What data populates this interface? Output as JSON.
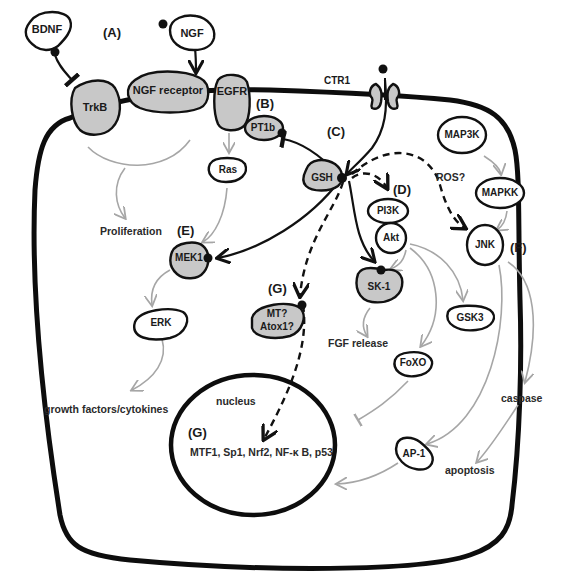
{
  "diagram": {
    "type": "signaling-pathway",
    "compartments": {
      "cell": "cell",
      "nucleus": "nucleus"
    },
    "section_labels": {
      "A": "(A)",
      "B": "(B)",
      "C": "(C)",
      "D": "(D)",
      "E": "(E)",
      "F": "(F)",
      "G1": "(G)",
      "G2": "(G)"
    },
    "nodes": {
      "bdnf": "BDNF",
      "ngf": "NGF",
      "trkb": "TrkB",
      "ngf_receptor": "NGF receptor",
      "egfr": "EGFR",
      "ctr1": "CTR1",
      "pt1b": "PT1b",
      "ras": "Ras",
      "gsh": "GSH",
      "pi3k": "PI3K",
      "akt": "Akt",
      "map3k": "MAP3K",
      "mapkk": "MAPKK",
      "jnk": "JNK",
      "mek1": "MEK1",
      "erk": "ERK",
      "mt_line1": "MT?",
      "mt_line2": "Atox1?",
      "sk1": "SK-1",
      "gsk3": "GSK3",
      "foxo": "FoXO",
      "ap1": "AP-1",
      "transcription_factors": "MTF1, Sp1, Nrf2, NF-κ B, p53"
    },
    "outcomes": {
      "proliferation": "Proliferation",
      "growth_factors": "growth factors/cytokines",
      "fgf_release": "FGF release",
      "caspase": "caspase",
      "apoptosis": "apoptosis",
      "ros": "ROS?"
    },
    "edges": [
      {
        "from": "BDNF",
        "to": "TrkB",
        "style": "inhibit"
      },
      {
        "from": "NGF",
        "to": "NGF receptor",
        "style": "activate"
      },
      {
        "from": "TrkB/NGF receptor",
        "to": "Proliferation",
        "style": "grey-activate"
      },
      {
        "from": "EGFR",
        "to": "Ras",
        "style": "grey-activate"
      },
      {
        "from": "Ras",
        "to": "MEK1",
        "style": "grey-activate"
      },
      {
        "from": "CTR1",
        "to": "GSH",
        "style": "activate"
      },
      {
        "from": "GSH",
        "to": "PT1b",
        "style": "inhibit"
      },
      {
        "from": "GSH",
        "to": "MEK1",
        "style": "activate"
      },
      {
        "from": "GSH",
        "to": "SK-1",
        "style": "activate"
      },
      {
        "from": "GSH",
        "to": "PI3K",
        "style": "dashed-activate"
      },
      {
        "from": "GSH",
        "to": "JNK",
        "style": "dashed-activate",
        "label": "ROS?"
      },
      {
        "from": "GSH",
        "to": "MT?/Atox1?",
        "style": "dashed-activate"
      },
      {
        "from": "MT?/Atox1?",
        "to": "nucleus TFs",
        "style": "dashed-activate"
      },
      {
        "from": "MAP3K",
        "to": "MAPKK",
        "style": "grey-activate"
      },
      {
        "from": "MAPKK",
        "to": "JNK",
        "style": "grey-activate"
      },
      {
        "from": "Akt",
        "to": "SK-1",
        "style": "grey-activate"
      },
      {
        "from": "Akt",
        "to": "GSK3",
        "style": "grey-activate"
      },
      {
        "from": "Akt",
        "to": "FoXO",
        "style": "grey-activate"
      },
      {
        "from": "SK-1",
        "to": "FGF release",
        "style": "grey-activate"
      },
      {
        "from": "MEK1",
        "to": "ERK",
        "style": "grey-activate"
      },
      {
        "from": "ERK",
        "to": "growth factors/cytokines",
        "style": "grey-activate"
      },
      {
        "from": "FoXO",
        "to": "nucleus",
        "style": "grey-inhibit"
      },
      {
        "from": "JNK",
        "to": "AP-1",
        "style": "grey-activate"
      },
      {
        "from": "JNK",
        "to": "caspase",
        "style": "grey-activate"
      },
      {
        "from": "caspase",
        "to": "apoptosis",
        "style": "grey-activate"
      },
      {
        "from": "AP-1",
        "to": "nucleus",
        "style": "grey-activate"
      }
    ],
    "colors": {
      "membrane": "#0d0d0d",
      "grey_node_fill": "#c8c8c8",
      "grey_arrow": "#a6a6a6",
      "background": "#ffffff"
    }
  }
}
